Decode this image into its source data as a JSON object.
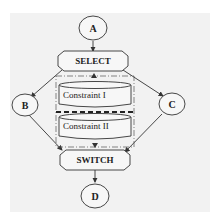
{
  "diagram": {
    "nodes": {
      "a": "A",
      "b": "B",
      "c": "C",
      "d": "D",
      "select": "SELECT",
      "switch": "SWITCH",
      "constraint1": "Constraint I",
      "constraint2": "Constraint II"
    },
    "edges": [
      {
        "from": "A",
        "to": "SELECT"
      },
      {
        "from": "SELECT",
        "to": "B"
      },
      {
        "from": "SELECT",
        "to": "C"
      },
      {
        "from": "SELECT",
        "to": "Constraint I"
      },
      {
        "from": "Constraint II",
        "to": "SWITCH"
      },
      {
        "from": "B",
        "to": "SWITCH"
      },
      {
        "from": "C",
        "to": "SWITCH"
      },
      {
        "from": "SWITCH",
        "to": "D"
      }
    ],
    "colors": {
      "background": "#f2f2f2",
      "stroke": "#333333",
      "fill": "#f7f7f7"
    }
  }
}
